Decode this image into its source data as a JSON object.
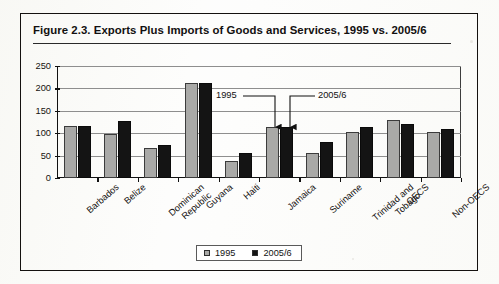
{
  "figure": {
    "title": "Figure 2.3.  Exports Plus Imports of Goods and Services, 1995 vs. 2005/6"
  },
  "legend": {
    "items": [
      {
        "label": "1995",
        "color": "#a9a9a7",
        "swatch": "square-gray-icon"
      },
      {
        "label": "2005/6",
        "color": "#141414",
        "swatch": "square-black-icon"
      }
    ]
  },
  "annotations": [
    {
      "label": "1995",
      "target": "jamaica-1995-bar"
    },
    {
      "label": "2005/6",
      "target": "jamaica-2005-bar"
    }
  ],
  "axis": {
    "y_ticks": [
      "250",
      "200",
      "150",
      "100",
      "50",
      "0"
    ]
  },
  "chart_data": {
    "type": "bar",
    "title": "Figure 2.3.  Exports Plus Imports of Goods and Services, 1995 vs. 2005/6",
    "xlabel": "",
    "ylabel": "",
    "ylim": [
      0,
      250
    ],
    "ytick_step": 50,
    "grid": true,
    "legend_position": "bottom-center",
    "categories": [
      "Barbados",
      "Belize",
      "Dominican Republic",
      "Guyana",
      "Haiti",
      "Jamaica",
      "Suriname",
      "Trinidad and Tobago",
      "OECS",
      "Non-OECS"
    ],
    "series": [
      {
        "name": "1995",
        "color": "#a9a9a7",
        "values": [
          117,
          99,
          67,
          213,
          37,
          113,
          55,
          103,
          130,
          103
        ]
      },
      {
        "name": "2005/6",
        "color": "#141414",
        "values": [
          117,
          127,
          73,
          213,
          55,
          113,
          80,
          113,
          120,
          110
        ]
      }
    ]
  }
}
